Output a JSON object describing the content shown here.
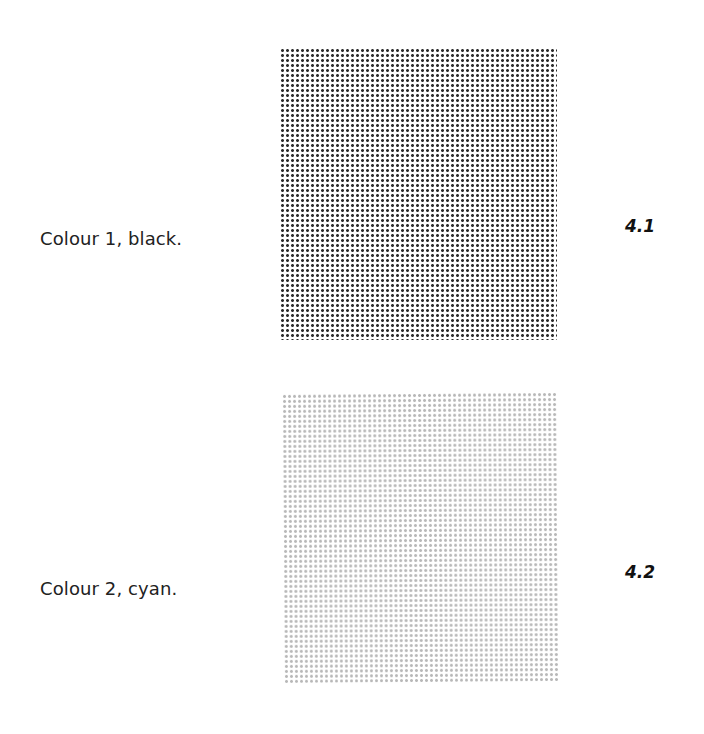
{
  "page": {
    "top_cutoff_text": "· · ·"
  },
  "figures": [
    {
      "caption": "Colour 1, black.",
      "label": "4.1",
      "swatch_color": "#2e2e2e",
      "pattern": "halftone dot grid"
    },
    {
      "caption": "Colour 2, cyan.",
      "label": "4.2",
      "swatch_color": "#b8b8b8",
      "pattern": "halftone dot grid"
    }
  ]
}
